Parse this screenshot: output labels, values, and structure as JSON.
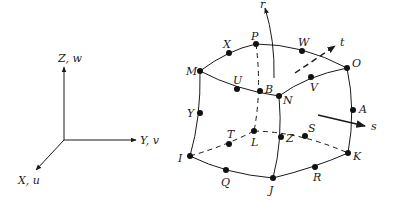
{
  "global_axes": {
    "z_label": "Z, w",
    "y_label": "Y, v",
    "x_label": "X, u"
  },
  "local_axes": {
    "r_label": "r",
    "s_label": "s",
    "t_label": "t"
  },
  "nodes": {
    "M": "M",
    "X": "X",
    "P": "P",
    "W": "W",
    "O": "O",
    "U": "U",
    "B": "B",
    "N": "N",
    "V": "V",
    "Y": "Y",
    "A": "A",
    "I": "I",
    "Q": "Q",
    "J": "J",
    "R": "R",
    "K": "K",
    "T": "T",
    "L": "L",
    "Z": "Z",
    "S": "S"
  },
  "colors": {
    "ink": "#1a1a1a",
    "background": "#ffffff"
  }
}
